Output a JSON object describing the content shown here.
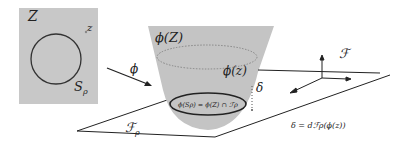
{
  "diagram": {
    "domain_box": {
      "label_big": "Z",
      "label_small": "z",
      "circle_label": "S",
      "circle_label_sub": "ρ",
      "fill": "#c8c8c8"
    },
    "map_arrow": {
      "label": "ϕ"
    },
    "cone": {
      "label_top": "ϕ(Z)",
      "label_point": "ϕ(z)",
      "label_distance": "δ",
      "intersection_label": "ϕ(Sρ) = ϕ(Z) ∩ ℱρ",
      "fill": "#c4c4c4"
    },
    "planes": {
      "lower_label": "ℱ",
      "lower_label_sub": "ρ",
      "upper_label": "ℱ"
    },
    "formula": "δ = dℱρ(ϕ(z))"
  }
}
